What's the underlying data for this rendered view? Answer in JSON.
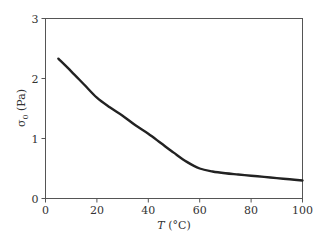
{
  "chart_data": {
    "type": "line",
    "title": "",
    "xlabel": "T (°C)",
    "xlabel_var": "T",
    "xlabel_unit": " (°C)",
    "ylabel": "σ0 (Pa)",
    "ylabel_var": "σ",
    "ylabel_sub": "0",
    "ylabel_unit": " (Pa)",
    "xlim": [
      0,
      100
    ],
    "ylim": [
      0,
      3
    ],
    "xticks": [
      0,
      20,
      40,
      60,
      80,
      100
    ],
    "yticks": [
      0,
      1,
      2,
      3
    ],
    "grid": false,
    "legend": null,
    "series": [
      {
        "name": "σ0 vs T",
        "color": "#222222",
        "x": [
          5,
          10,
          15,
          20,
          25,
          30,
          35,
          40,
          45,
          50,
          55,
          60,
          65,
          70,
          75,
          80,
          85,
          90,
          95,
          100
        ],
        "y": [
          2.33,
          2.12,
          1.9,
          1.68,
          1.52,
          1.38,
          1.22,
          1.08,
          0.92,
          0.76,
          0.61,
          0.5,
          0.45,
          0.42,
          0.4,
          0.38,
          0.36,
          0.34,
          0.32,
          0.3
        ]
      }
    ]
  }
}
